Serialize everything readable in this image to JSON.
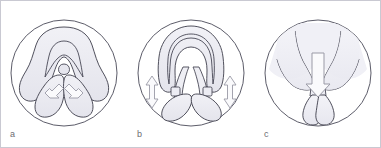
{
  "figure": {
    "kind": "anatomical-illustration",
    "frame_border_color": "#c9c9d2",
    "background_color": "#ffffff",
    "panel_count": 3,
    "outline_color": "#3a3a4a",
    "tissue_fill": "#e9e9f0",
    "tissue_fill_light": "#f2f2f7",
    "arrow_fill": "#f7f7fa",
    "arrow_outline": "#9a9aa6",
    "label_color": "#6d6d72"
  },
  "panels": [
    {
      "id": "panel-a",
      "label": "a",
      "description": "Narrow, tall configuration with two inward-pointing arrows converging on the midline",
      "arrows": [
        {
          "name": "arrow-up-left",
          "direction": "up-right",
          "count": 1
        },
        {
          "name": "arrow-up-right",
          "direction": "up-left",
          "count": 1
        }
      ]
    },
    {
      "id": "panel-b",
      "label": "b",
      "description": "Rounded configuration with two bidirectional vertical arrows at the lateral margins",
      "arrows": [
        {
          "name": "arrow-double-vertical-left",
          "direction": "up-down",
          "count": 1
        },
        {
          "name": "arrow-double-vertical-right",
          "direction": "up-down",
          "count": 1
        }
      ]
    },
    {
      "id": "panel-c",
      "label": "c",
      "description": "Wide, flattened configuration with a single large downward arrow on the midline",
      "arrows": [
        {
          "name": "arrow-down-center",
          "direction": "down",
          "count": 1
        }
      ]
    }
  ]
}
